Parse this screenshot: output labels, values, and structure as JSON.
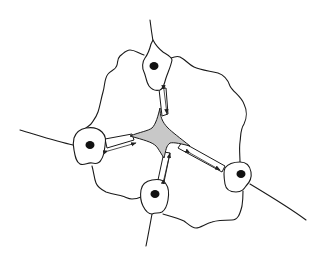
{
  "diagram": {
    "colors": {
      "background": "#ffffff",
      "stroke": "#1a1a1a",
      "center_fill": "#c8c8c8",
      "nucleus": "#111111"
    },
    "cells": [
      {
        "id": "top",
        "nucleus": [
          154,
          66
        ]
      },
      {
        "id": "left",
        "nucleus": [
          90,
          145
        ]
      },
      {
        "id": "bottom",
        "nucleus": [
          155,
          194
        ]
      },
      {
        "id": "right",
        "nucleus": [
          241,
          174
        ]
      }
    ],
    "center_region": {
      "shape": "four-pointed star",
      "center": [
        158,
        133
      ]
    },
    "arrows": [
      {
        "between": [
          "top",
          "center"
        ],
        "direction": "bidirectional"
      },
      {
        "between": [
          "left",
          "center"
        ],
        "direction": "bidirectional"
      },
      {
        "between": [
          "bottom",
          "center"
        ],
        "direction": "bidirectional"
      },
      {
        "between": [
          "right",
          "center"
        ],
        "direction": "bidirectional"
      }
    ],
    "labels": []
  }
}
